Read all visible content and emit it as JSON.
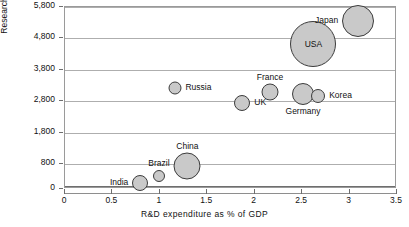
{
  "chart_data": {
    "type": "scatter",
    "title": "",
    "xlabel": "R&D  expenditure  as  %  of  GDP",
    "ylabel": "Researchers  per  million",
    "xlim": [
      0,
      3.5
    ],
    "ylim": [
      0,
      5800
    ],
    "grid": true,
    "legend": "none",
    "x_ticks": [
      "0",
      "0.5",
      "1",
      "1.5",
      "2",
      "2.5",
      "3",
      "3.5"
    ],
    "x_tick_values": [
      0,
      0.5,
      1,
      1.5,
      2,
      2.5,
      3,
      3.5
    ],
    "y_ticks": [
      "0",
      "800",
      "1,800",
      "2,800",
      "3,800",
      "4,800",
      "5,800"
    ],
    "y_tick_values": [
      0,
      800,
      1800,
      2800,
      3800,
      4800,
      5800
    ],
    "bubble_note": "Bubble area encodes relative size of the national research effort",
    "points": [
      {
        "name": "India",
        "x": 0.8,
        "y": 170,
        "r": 8.0,
        "label": "India",
        "label_pos": "left",
        "inner": false
      },
      {
        "name": "Brazil",
        "x": 1.0,
        "y": 390,
        "r": 6.0,
        "label": "Brazil",
        "label_pos": "above",
        "inner": false
      },
      {
        "name": "China",
        "x": 1.3,
        "y": 700,
        "r": 13.5,
        "label": "China",
        "label_pos": "above",
        "inner": false
      },
      {
        "name": "Russia",
        "x": 1.17,
        "y": 3200,
        "r": 6.5,
        "label": "Russia",
        "label_pos": "right",
        "inner": false
      },
      {
        "name": "UK",
        "x": 1.88,
        "y": 2700,
        "r": 8.0,
        "label": "UK",
        "label_pos": "right",
        "inner": false
      },
      {
        "name": "France",
        "x": 2.17,
        "y": 3050,
        "r": 8.5,
        "label": "France",
        "label_pos": "above",
        "inner": false
      },
      {
        "name": "Germany",
        "x": 2.52,
        "y": 3000,
        "r": 11.0,
        "label": "Germany",
        "label_pos": "below",
        "inner": false
      },
      {
        "name": "Korea",
        "x": 2.68,
        "y": 2930,
        "r": 7.0,
        "label": "Korea",
        "label_pos": "right",
        "inner": false
      },
      {
        "name": "USA",
        "x": 2.63,
        "y": 4600,
        "r": 23.0,
        "label": "USA",
        "label_pos": "inner",
        "inner": true
      },
      {
        "name": "Japan",
        "x": 3.1,
        "y": 5330,
        "r": 16.0,
        "label": "Japan",
        "label_pos": "left",
        "inner": false
      }
    ]
  }
}
